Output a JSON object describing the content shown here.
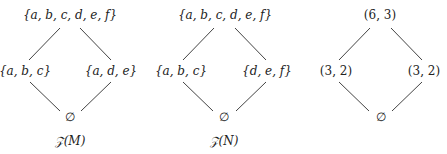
{
  "diagrams": [
    {
      "name": "Z(M)",
      "caption": "𝒵(M)",
      "top": "{a, b, c, d, e, f}",
      "left": "{a, b, c}",
      "right": "{a, d, e}",
      "bottom": "∅"
    },
    {
      "name": "Z(N)",
      "caption": "𝒵(N)",
      "top": "{a, b, c, d, e, f}",
      "left": "{a, b, c}",
      "right": "{d, e, f}",
      "bottom": "∅"
    },
    {
      "name": "rank-size",
      "caption": "",
      "top": "(6, 3)",
      "left": "(3, 2)",
      "right": "(3, 2)",
      "bottom": "∅"
    }
  ],
  "colors": {
    "line": "#444444",
    "text": "#222222",
    "background": "#ffffff"
  }
}
